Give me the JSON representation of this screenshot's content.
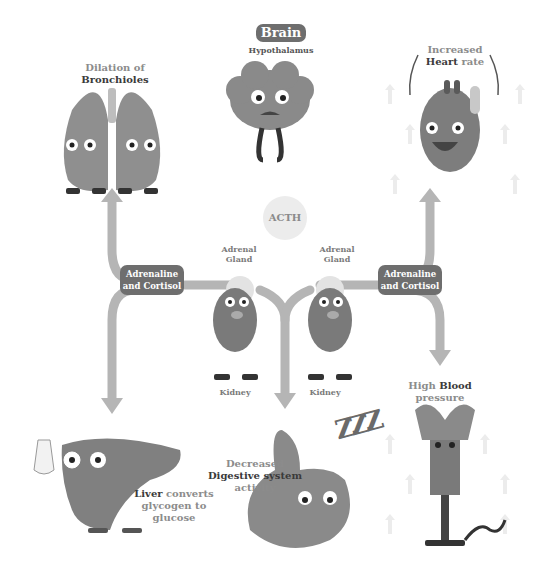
{
  "title": {
    "badge": "Brain",
    "subtitle": "Hypothalamus"
  },
  "hormone": "ACTH",
  "organs": {
    "lungs": {
      "line1": "Dilation of",
      "line2_bold": "Bronchioles"
    },
    "heart": {
      "line1": "Increased",
      "line2_bold": "Heart",
      "line2_rest": " rate"
    },
    "adrenal_left": {
      "gland_line1": "Adrenal",
      "gland_line2": "Gland",
      "kidney": "Kidney"
    },
    "adrenal_right": {
      "gland_line1": "Adrenal",
      "gland_line2": "Gland",
      "kidney": "Kidney"
    },
    "liver": {
      "bold": "Liver",
      "rest1": " converts",
      "line2": "glycogen to",
      "line3": "glucose"
    },
    "stomach": {
      "line1": "Decreased",
      "line2_bold": "Digestive system",
      "line3": "activity"
    },
    "blood": {
      "line1": "High ",
      "line1_bold": "Blood",
      "line2": "pressure"
    }
  },
  "hormone_badges": {
    "left": {
      "line1": "Adrenaline",
      "line2": "and Cortisol"
    },
    "right": {
      "line1": "Adrenaline",
      "line2": "and Cortisol"
    }
  },
  "colors": {
    "badge_bg": "#6e6e6e",
    "arrow": "#b5b5b5",
    "organ_fill": "#8a8a8a",
    "organ_dark": "#6a6a6a",
    "label_grey": "#8c8c8c",
    "label_dark": "#3a3a3a"
  },
  "sleep_glyph": "ZZZ"
}
